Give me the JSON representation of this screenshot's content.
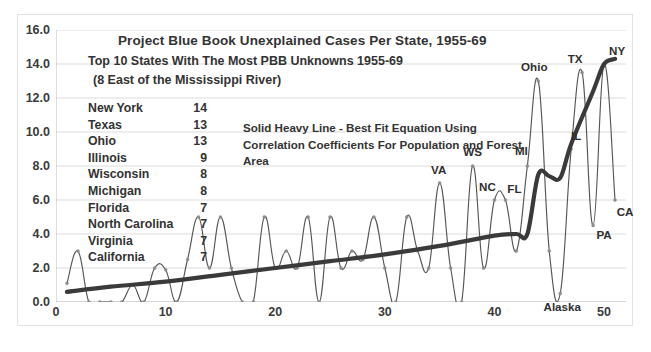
{
  "chart_data": {
    "type": "line",
    "title": "Project Blue Book Unexplained Cases  Per State, 1955-69",
    "subtitle_1": "Top 10 States With The Most PBB Unknowns 1955-69",
    "subtitle_2": "(8 East of the Mississippi River)",
    "xlabel": "",
    "ylabel": "",
    "xlim": [
      0,
      52
    ],
    "ylim": [
      0,
      16
    ],
    "xticks": [
      0,
      10,
      20,
      30,
      40,
      50
    ],
    "yticks": [
      "0.0",
      "2.0",
      "4.0",
      "6.0",
      "8.0",
      "10.0",
      "12.0",
      "14.0",
      "16.0"
    ],
    "grid": true,
    "legend_position": "none",
    "annotation": [
      "Solid  Heavy Line - Best Fit Equation Using",
      "Correlation Coefficients  For Population and Forest",
      "Area"
    ],
    "top_states": {
      "header_name": "State",
      "header_value": "Unknowns",
      "rows": [
        {
          "name": "New York",
          "value": "14"
        },
        {
          "name": "Texas",
          "value": "13"
        },
        {
          "name": "Ohio",
          "value": "13"
        },
        {
          "name": "Illinois",
          "value": "9"
        },
        {
          "name": "Wisconsin",
          "value": "8"
        },
        {
          "name": "Michigan",
          "value": "8"
        },
        {
          "name": "Florida",
          "value": "7"
        },
        {
          "name": "North Carolina",
          "value": "7"
        },
        {
          "name": "Virginia",
          "value": "7"
        },
        {
          "name": "California",
          "value": "7"
        }
      ]
    },
    "series": [
      {
        "name": "Unexplained cases per state",
        "style": "thin-line-with-markers",
        "color": "#555555",
        "x": [
          1,
          2,
          3,
          4,
          5,
          6,
          7,
          8,
          9,
          10,
          11,
          12,
          13,
          14,
          15,
          16,
          17,
          18,
          19,
          20,
          21,
          22,
          23,
          24,
          25,
          26,
          27,
          28,
          29,
          30,
          31,
          32,
          33,
          34,
          35,
          36,
          37,
          38,
          39,
          40,
          41,
          42,
          43,
          44,
          45,
          46,
          47,
          48,
          49,
          50,
          51
        ],
        "values": [
          1.1,
          3.0,
          0.0,
          0.0,
          0.0,
          0.0,
          1.0,
          0.0,
          2.0,
          1.9,
          0.0,
          2.5,
          5.0,
          2.0,
          5.0,
          2.0,
          0.0,
          0.0,
          5.0,
          2.0,
          3.0,
          2.0,
          5.0,
          0.0,
          5.0,
          2.0,
          3.0,
          2.5,
          5.0,
          2.0,
          0.0,
          5.0,
          3.0,
          2.0,
          7.0,
          2.0,
          0.0,
          8.0,
          2.0,
          6.0,
          6.0,
          3.0,
          8.0,
          13.0,
          3.0,
          0.5,
          9.0,
          13.5,
          4.5,
          14.0,
          6.0
        ]
      },
      {
        "name": "Best fit equation (population & forest area)",
        "style": "thick-solid-line",
        "color": "#3a3a3a",
        "x": [
          1,
          5,
          10,
          15,
          20,
          25,
          30,
          35,
          40,
          42,
          43,
          44,
          45,
          46,
          47,
          49,
          50,
          51
        ],
        "values": [
          0.6,
          0.9,
          1.2,
          1.6,
          2.0,
          2.4,
          2.8,
          3.3,
          3.9,
          4.0,
          4.0,
          7.5,
          7.4,
          7.3,
          9.3,
          12.4,
          14.0,
          14.3
        ]
      }
    ],
    "point_labels": [
      {
        "text": "VA",
        "x": 35,
        "y": 7.0
      },
      {
        "text": "WS",
        "x": 38,
        "y": 8.0
      },
      {
        "text": "NC",
        "x": 40,
        "y": 6.0
      },
      {
        "text": "FL",
        "x": 41,
        "y": 6.0
      },
      {
        "text": "MI",
        "x": 43,
        "y": 8.0
      },
      {
        "text": "Ohio",
        "x": 44,
        "y": 13.0
      },
      {
        "text": "IL",
        "x": 47,
        "y": 9.0
      },
      {
        "text": "TX",
        "x": 48,
        "y": 13.5
      },
      {
        "text": "NY",
        "x": 50,
        "y": 14.0
      },
      {
        "text": "CA",
        "x": 51,
        "y": 6.0
      },
      {
        "text": "PA",
        "x": 49,
        "y": 4.5
      },
      {
        "text": "Alaska",
        "x": 46,
        "y": 0.5
      }
    ]
  },
  "colors": {
    "background": "#ffffff",
    "grid": "#dcdcdc",
    "axis": "#bdbdbd",
    "text": "#333333",
    "data_line": "#555555",
    "trend_line": "#3a3a3a",
    "frame": "#e2e2e2"
  }
}
